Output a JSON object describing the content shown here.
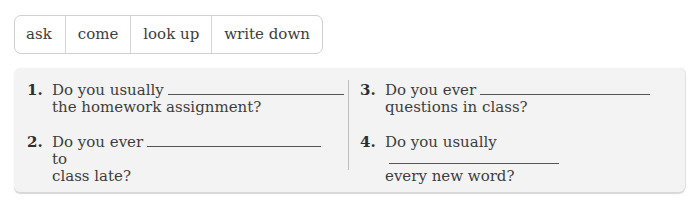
{
  "word_bank": [
    "ask",
    "come",
    "look up",
    "write down"
  ],
  "questions": [
    {
      "num": "1.",
      "before": "Do you usually",
      "after": "",
      "line2": "the homework assignment?"
    },
    {
      "num": "2.",
      "before": "Do you ever",
      "after": "to",
      "line2": "class late?"
    },
    {
      "num": "3.",
      "before": "Do you ever",
      "after": "",
      "line2": "questions in class?"
    },
    {
      "num": "4.",
      "before": "Do you usually",
      "after": "",
      "line2": "every new word?"
    }
  ]
}
